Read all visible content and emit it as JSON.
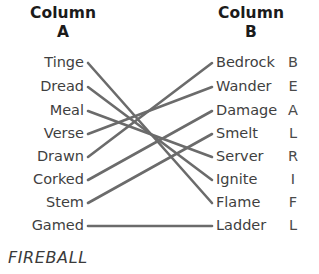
{
  "headers": {
    "left_line1": "Column",
    "left_line2": "A",
    "right_line1": "Column",
    "right_line2": "B"
  },
  "column_a": [
    {
      "label": "Tinge"
    },
    {
      "label": "Dread"
    },
    {
      "label": "Meal"
    },
    {
      "label": "Verse"
    },
    {
      "label": "Drawn"
    },
    {
      "label": "Corked"
    },
    {
      "label": "Stem"
    },
    {
      "label": "Gamed"
    }
  ],
  "column_b": [
    {
      "label": "Bedrock",
      "letter": "B"
    },
    {
      "label": "Wander",
      "letter": "E"
    },
    {
      "label": "Damage",
      "letter": "A"
    },
    {
      "label": "Smelt",
      "letter": "L"
    },
    {
      "label": "Server",
      "letter": "R"
    },
    {
      "label": "Ignite",
      "letter": "I"
    },
    {
      "label": "Flame",
      "letter": "F"
    },
    {
      "label": "Ladder",
      "letter": "L"
    }
  ],
  "connections": [
    {
      "from": 0,
      "to": 6
    },
    {
      "from": 1,
      "to": 5
    },
    {
      "from": 2,
      "to": 4
    },
    {
      "from": 3,
      "to": 1
    },
    {
      "from": 4,
      "to": 0
    },
    {
      "from": 5,
      "to": 2
    },
    {
      "from": 6,
      "to": 3
    },
    {
      "from": 7,
      "to": 7
    }
  ],
  "answer": "FIREBALL",
  "colors": {
    "line": "#6b6b6b",
    "text": "#3f3f3f",
    "heading": "#1b1b1b",
    "background": "#ffffff"
  },
  "geometry": {
    "row_y": [
      63,
      87,
      111,
      134,
      157,
      180,
      203,
      226
    ],
    "left_x": 88,
    "right_x": 212
  }
}
